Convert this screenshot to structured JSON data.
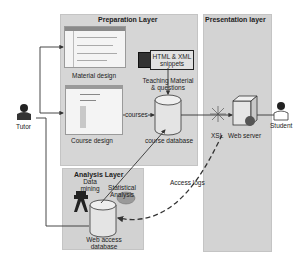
{
  "layers": {
    "preparation": {
      "title": "Preparation Layer"
    },
    "analysis": {
      "title": "Analysis Layer"
    },
    "presentation": {
      "title": "Presentation layer"
    }
  },
  "actors": {
    "tutor": {
      "label": "Tutor",
      "icon": "person-icon"
    },
    "student": {
      "label": "Student",
      "icon": "person-icon"
    }
  },
  "components": {
    "material_design": {
      "label": "Material design",
      "icon": "screenshot-icon"
    },
    "course_design": {
      "label": "Course design",
      "icon": "screenshot-icon"
    },
    "html_xml": {
      "label": "HTML & XML snippets",
      "line1": "HTML & XML",
      "line2": "snippets"
    },
    "teaching_material": {
      "line1": "Teaching Material",
      "line2": "& questions"
    },
    "course_database": {
      "label": "course database",
      "icon": "database-icon"
    },
    "courses_edge": {
      "label": "courses"
    },
    "data_mining": {
      "line1": "Data",
      "line2": "mining",
      "icon": "telescope-icon"
    },
    "statistical_analysis": {
      "line1": "Statistical",
      "line2": "Analysis",
      "icon": "chart-icon"
    },
    "web_access_db": {
      "line1": "Web access",
      "line2": "database",
      "icon": "database-icon"
    },
    "xsl": {
      "label": "XSL",
      "icon": "spark-icon"
    },
    "web_server": {
      "label": "Web server",
      "icon": "server-icon"
    },
    "access_logs": {
      "label": "Access logs"
    }
  },
  "colors": {
    "panel": "#d6d6d6",
    "panel_dark": "#cfcfcf",
    "line": "#333333",
    "db_fill": "#e8e8e8"
  }
}
